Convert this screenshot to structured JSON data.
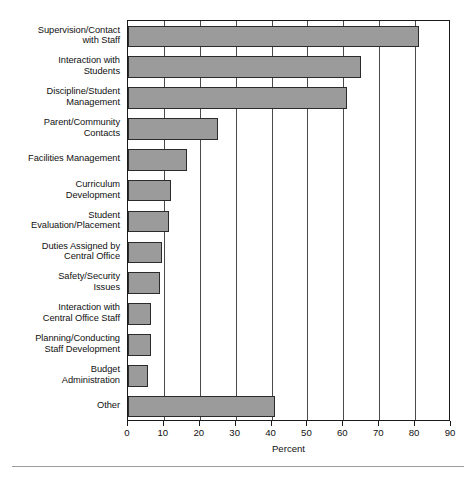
{
  "chart_data": {
    "type": "bar",
    "orientation": "horizontal",
    "title": "",
    "xlabel": "Percent",
    "ylabel": "",
    "xlim": [
      0,
      90
    ],
    "ylim": null,
    "grid": true,
    "legend": null,
    "xticks": [
      0,
      10,
      20,
      30,
      40,
      50,
      60,
      70,
      80,
      90
    ],
    "xtick_labels": [
      "0",
      "10",
      "20",
      "30",
      "40",
      "50",
      "60",
      "70",
      "80",
      "90"
    ],
    "categories": [
      "Supervision/Contact with Staff",
      "Interaction with Students",
      "Discipline/Student Management",
      "Parent/Community Contacts",
      "Facilities Management",
      "Curriculum Development",
      "Student Evaluation/Placement",
      "Duties Assigned by Central Office",
      "Safety/Security Issues",
      "Interaction with Central Office Staff",
      "Planning/Conducting Staff Development",
      "Budget Administration",
      "Other"
    ],
    "category_lines": [
      [
        "Supervision/Contact",
        "with Staff"
      ],
      [
        "Interaction with",
        "Students"
      ],
      [
        "Discipline/Student",
        "Management"
      ],
      [
        "Parent/Community",
        "Contacts"
      ],
      [
        "Facilities Management"
      ],
      [
        "Curriculum",
        "Development"
      ],
      [
        "Student",
        "Evaluation/Placement"
      ],
      [
        "Duties Assigned by",
        "Central Office"
      ],
      [
        "Safety/Security",
        "Issues"
      ],
      [
        "Interaction with",
        "Central Office Staff"
      ],
      [
        "Planning/Conducting",
        "Staff Development"
      ],
      [
        "Budget",
        "Administration"
      ],
      [
        "Other"
      ]
    ],
    "values": [
      81,
      65,
      61,
      25,
      16.5,
      12,
      11.5,
      9.5,
      9,
      6.5,
      6.5,
      5.5,
      41
    ],
    "series_name": "Percent",
    "bar_color": "#9b9b9b",
    "bar_edge_color": "#2b2b2b",
    "axis_color": "#1a1a1a",
    "grid_color": "#4a4a4a",
    "background": "#ffffff"
  },
  "footer": {
    "marks": ""
  }
}
